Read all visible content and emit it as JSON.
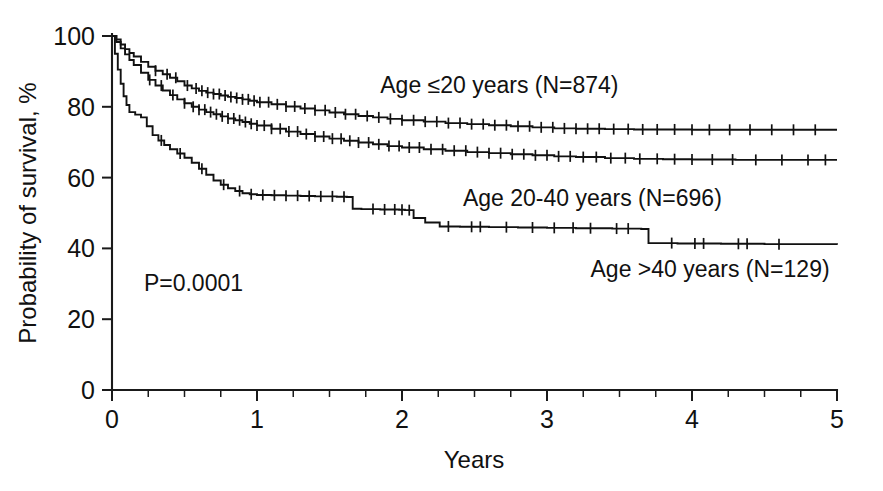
{
  "chart_data": {
    "type": "line",
    "subtype": "kaplan-meier-survival",
    "title": "",
    "xlabel": "Years",
    "ylabel": "Probability of survival, %",
    "xlim": [
      0,
      5
    ],
    "ylim": [
      0,
      100
    ],
    "xticks": [
      0,
      1,
      2,
      3,
      4,
      5
    ],
    "xtick_labels": [
      "0",
      "1",
      "2",
      "3",
      "4",
      "5"
    ],
    "xminor_step": 0.25,
    "yticks": [
      0,
      20,
      40,
      60,
      80,
      100
    ],
    "ytick_labels": [
      "0",
      "20",
      "40",
      "60",
      "80",
      "100"
    ],
    "grid": false,
    "legend_position": "inline-annotations",
    "annotations": [
      {
        "name": "p-value",
        "text": "P=0.0001",
        "x": 0.22,
        "y": 28
      }
    ],
    "series": [
      {
        "name": "Age ≤20 years (N=874)",
        "label": "Age ≤20 years (N=874)",
        "group": "Age ≤20 years",
        "n": 874,
        "color": "#111111",
        "label_x": 1.85,
        "label_y": 84,
        "five_year_survival": 73.5,
        "points": [
          [
            0.0,
            100.0
          ],
          [
            0.03,
            99.0
          ],
          [
            0.06,
            97.6
          ],
          [
            0.09,
            96.3
          ],
          [
            0.12,
            95.2
          ],
          [
            0.15,
            94.2
          ],
          [
            0.2,
            92.7
          ],
          [
            0.25,
            91.3
          ],
          [
            0.3,
            90.2
          ],
          [
            0.35,
            89.2
          ],
          [
            0.4,
            88.2
          ],
          [
            0.45,
            87.2
          ],
          [
            0.5,
            86.0
          ],
          [
            0.55,
            85.2
          ],
          [
            0.6,
            84.5
          ],
          [
            0.65,
            84.0
          ],
          [
            0.7,
            83.6
          ],
          [
            0.75,
            83.2
          ],
          [
            0.8,
            82.8
          ],
          [
            0.85,
            82.5
          ],
          [
            0.9,
            82.1
          ],
          [
            0.95,
            81.7
          ],
          [
            1.0,
            81.3
          ],
          [
            1.1,
            80.7
          ],
          [
            1.2,
            80.1
          ],
          [
            1.3,
            79.5
          ],
          [
            1.4,
            79.0
          ],
          [
            1.5,
            78.4
          ],
          [
            1.6,
            77.9
          ],
          [
            1.7,
            77.4
          ],
          [
            1.8,
            77.0
          ],
          [
            1.9,
            76.6
          ],
          [
            2.0,
            76.2
          ],
          [
            2.15,
            75.8
          ],
          [
            2.3,
            75.4
          ],
          [
            2.45,
            75.1
          ],
          [
            2.6,
            74.8
          ],
          [
            2.75,
            74.5
          ],
          [
            2.9,
            74.2
          ],
          [
            3.05,
            73.9
          ],
          [
            3.2,
            73.8
          ],
          [
            3.4,
            73.7
          ],
          [
            3.6,
            73.6
          ],
          [
            3.8,
            73.6
          ],
          [
            4.0,
            73.5
          ],
          [
            4.3,
            73.5
          ],
          [
            4.6,
            73.5
          ],
          [
            5.0,
            73.5
          ]
        ],
        "censor_x": [
          0.3,
          0.38,
          0.44,
          0.52,
          0.58,
          0.62,
          0.66,
          0.7,
          0.74,
          0.78,
          0.82,
          0.86,
          0.9,
          0.94,
          0.98,
          1.02,
          1.08,
          1.14,
          1.2,
          1.26,
          1.33,
          1.4,
          1.47,
          1.54,
          1.61,
          1.68,
          1.76,
          1.84,
          1.92,
          2.0,
          2.08,
          2.16,
          2.24,
          2.32,
          2.4,
          2.48,
          2.56,
          2.64,
          2.72,
          2.8,
          2.88,
          2.96,
          3.04,
          3.12,
          3.2,
          3.28,
          3.36,
          3.46,
          3.56,
          3.66,
          3.76,
          3.88,
          4.0,
          4.12,
          4.26,
          4.4,
          4.55,
          4.7,
          4.85
        ]
      },
      {
        "name": "Age 20-40 years (N=696)",
        "label": "Age 20-40 years (N=696)",
        "group": "Age 20-40 years",
        "n": 696,
        "color": "#111111",
        "label_x": 2.42,
        "label_y": 52,
        "five_year_survival": 65.0,
        "points": [
          [
            0.0,
            100.0
          ],
          [
            0.03,
            98.3
          ],
          [
            0.06,
            96.5
          ],
          [
            0.09,
            94.8
          ],
          [
            0.12,
            93.2
          ],
          [
            0.15,
            91.8
          ],
          [
            0.2,
            89.6
          ],
          [
            0.25,
            87.6
          ],
          [
            0.3,
            86.0
          ],
          [
            0.35,
            84.6
          ],
          [
            0.4,
            83.3
          ],
          [
            0.45,
            82.1
          ],
          [
            0.5,
            81.0
          ],
          [
            0.55,
            80.0
          ],
          [
            0.6,
            79.2
          ],
          [
            0.65,
            78.5
          ],
          [
            0.7,
            77.9
          ],
          [
            0.75,
            77.3
          ],
          [
            0.8,
            76.7
          ],
          [
            0.85,
            76.2
          ],
          [
            0.9,
            75.7
          ],
          [
            0.95,
            75.2
          ],
          [
            1.0,
            74.7
          ],
          [
            1.1,
            73.8
          ],
          [
            1.2,
            73.0
          ],
          [
            1.3,
            72.3
          ],
          [
            1.4,
            71.6
          ],
          [
            1.5,
            71.0
          ],
          [
            1.6,
            70.4
          ],
          [
            1.7,
            69.9
          ],
          [
            1.8,
            69.4
          ],
          [
            1.9,
            68.9
          ],
          [
            2.0,
            68.5
          ],
          [
            2.15,
            68.0
          ],
          [
            2.3,
            67.6
          ],
          [
            2.45,
            67.2
          ],
          [
            2.6,
            66.9
          ],
          [
            2.75,
            66.6
          ],
          [
            2.9,
            66.3
          ],
          [
            3.05,
            66.0
          ],
          [
            3.2,
            65.8
          ],
          [
            3.4,
            65.5
          ],
          [
            3.6,
            65.3
          ],
          [
            3.8,
            65.2
          ],
          [
            4.0,
            65.1
          ],
          [
            4.3,
            65.0
          ],
          [
            4.6,
            65.0
          ],
          [
            5.0,
            65.0
          ]
        ],
        "censor_x": [
          0.26,
          0.34,
          0.42,
          0.5,
          0.56,
          0.6,
          0.64,
          0.68,
          0.72,
          0.76,
          0.8,
          0.84,
          0.88,
          0.92,
          0.96,
          1.0,
          1.05,
          1.1,
          1.16,
          1.22,
          1.28,
          1.34,
          1.4,
          1.46,
          1.52,
          1.58,
          1.64,
          1.7,
          1.77,
          1.84,
          1.91,
          1.98,
          2.05,
          2.12,
          2.2,
          2.28,
          2.36,
          2.44,
          2.52,
          2.6,
          2.68,
          2.76,
          2.84,
          2.92,
          3.0,
          3.08,
          3.16,
          3.25,
          3.34,
          3.44,
          3.54,
          3.64,
          3.76,
          3.88,
          4.0,
          4.14,
          4.28,
          4.44,
          4.62,
          4.8,
          4.92
        ]
      },
      {
        "name": "Age >40 years (N=129)",
        "label": "Age >40 years (N=129)",
        "group": "Age >40 years",
        "n": 129,
        "color": "#111111",
        "label_x": 3.3,
        "label_y": 32,
        "five_year_survival": 41.0,
        "points": [
          [
            0.0,
            100.0
          ],
          [
            0.02,
            95.0
          ],
          [
            0.04,
            90.5
          ],
          [
            0.06,
            86.5
          ],
          [
            0.08,
            83.0
          ],
          [
            0.1,
            80.5
          ],
          [
            0.12,
            78.5
          ],
          [
            0.16,
            77.8
          ],
          [
            0.2,
            77.0
          ],
          [
            0.24,
            74.5
          ],
          [
            0.28,
            72.0
          ],
          [
            0.32,
            70.5
          ],
          [
            0.36,
            69.2
          ],
          [
            0.4,
            68.0
          ],
          [
            0.45,
            66.8
          ],
          [
            0.5,
            65.6
          ],
          [
            0.55,
            64.2
          ],
          [
            0.6,
            62.5
          ],
          [
            0.65,
            60.8
          ],
          [
            0.7,
            59.2
          ],
          [
            0.75,
            58.0
          ],
          [
            0.8,
            57.0
          ],
          [
            0.85,
            56.2
          ],
          [
            0.9,
            55.6
          ],
          [
            0.95,
            55.3
          ],
          [
            1.0,
            55.1
          ],
          [
            1.1,
            55.0
          ],
          [
            1.2,
            54.9
          ],
          [
            1.3,
            54.8
          ],
          [
            1.4,
            54.7
          ],
          [
            1.55,
            54.6
          ],
          [
            1.62,
            54.5
          ],
          [
            1.66,
            51.2
          ],
          [
            1.72,
            51.1
          ],
          [
            1.85,
            51.0
          ],
          [
            1.98,
            50.9
          ],
          [
            2.02,
            50.8
          ],
          [
            2.08,
            48.6
          ],
          [
            2.16,
            47.3
          ],
          [
            2.26,
            46.2
          ],
          [
            2.4,
            46.1
          ],
          [
            2.6,
            46.0
          ],
          [
            2.8,
            45.9
          ],
          [
            3.0,
            45.8
          ],
          [
            3.2,
            45.7
          ],
          [
            3.45,
            45.6
          ],
          [
            3.65,
            45.5
          ],
          [
            3.7,
            41.5
          ],
          [
            3.9,
            41.4
          ],
          [
            4.2,
            41.3
          ],
          [
            4.5,
            41.2
          ],
          [
            5.0,
            41.0
          ]
        ],
        "censor_x": [
          0.34,
          0.47,
          0.62,
          0.77,
          0.88,
          0.96,
          1.04,
          1.12,
          1.2,
          1.28,
          1.36,
          1.44,
          1.52,
          1.6,
          1.8,
          1.88,
          1.95,
          2.0,
          2.05,
          2.32,
          2.48,
          2.54,
          2.72,
          2.9,
          3.05,
          3.18,
          3.3,
          3.48,
          3.56,
          3.86,
          4.02,
          4.08,
          4.32,
          4.38,
          4.6
        ]
      }
    ]
  },
  "figure": {
    "background_color": "#ffffff",
    "line_color": "#111111",
    "axis_color": "#1a1a1a"
  }
}
